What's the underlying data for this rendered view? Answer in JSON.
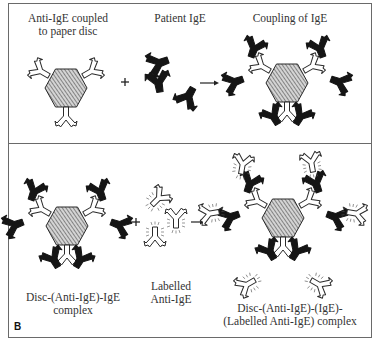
{
  "figure": {
    "panel_letter": "B",
    "top_panel": {
      "label_disc": [
        "Anti-IgE coupled",
        "to paper disc"
      ],
      "label_patient": "Patient IgE",
      "label_coupling": "Coupling of IgE",
      "operator": "+"
    },
    "bottom_panel": {
      "label_complex": [
        "Disc-(Anti-IgE)-IgE",
        "complex"
      ],
      "label_labelled": [
        "Labelled",
        "Anti-IgE"
      ],
      "label_result": [
        "Disc-(Anti-IgE)-(IgE)-",
        "(Labelled Anti-IgE) complex"
      ],
      "operator": "+"
    },
    "icons": {
      "disc": "hatched-hexagon-disc",
      "anti_ige": "open-y-antibody",
      "patient_ige": "filled-y-antibody",
      "labelled_anti_ige": "open-y-antibody-with-radiating-marks",
      "arrow": "right-arrow"
    },
    "colors": {
      "line": "#2a2a2a",
      "fill_dark": "#151515",
      "disc_fill": "#bdbdbd",
      "frame": "#6a6a6a"
    }
  }
}
